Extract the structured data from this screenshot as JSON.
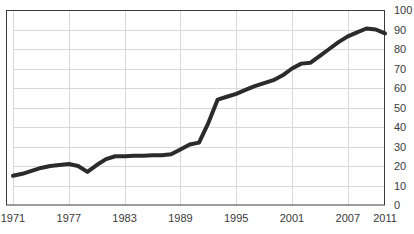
{
  "chart_data": {
    "type": "line",
    "title": "",
    "subtitle": "",
    "xlabel": "",
    "ylabel": "",
    "xlim": [
      1971,
      2011
    ],
    "ylim": [
      0,
      100
    ],
    "grid": true,
    "legend": false,
    "legend_position": "none",
    "y_axis_position": "right",
    "x_tick_labels": [
      "1971",
      "1977",
      "1983",
      "1989",
      "1995",
      "2001",
      "2007",
      "2011"
    ],
    "x_tick_values": [
      1971,
      1977,
      1983,
      1989,
      1995,
      2001,
      2007,
      2011
    ],
    "y_tick_labels": [
      "0",
      "10",
      "20",
      "30",
      "40",
      "50",
      "60",
      "70",
      "80",
      "90",
      "100"
    ],
    "y_tick_values": [
      0,
      10,
      20,
      30,
      40,
      50,
      60,
      70,
      80,
      90,
      100
    ],
    "x": [
      1971,
      1972,
      1973,
      1974,
      1975,
      1976,
      1977,
      1978,
      1979,
      1980,
      1981,
      1982,
      1983,
      1984,
      1985,
      1986,
      1987,
      1988,
      1989,
      1990,
      1991,
      1992,
      1993,
      1994,
      1995,
      1996,
      1997,
      1998,
      1999,
      2000,
      2001,
      2002,
      2003,
      2004,
      2005,
      2006,
      2007,
      2008,
      2009,
      2010,
      2011
    ],
    "values": [
      15,
      16,
      17.5,
      19,
      20,
      20.5,
      21,
      20,
      17,
      20.5,
      23.5,
      25,
      25,
      25.2,
      25.3,
      25.5,
      25.5,
      26,
      28.5,
      31,
      32,
      42,
      54,
      55.5,
      57,
      59,
      61,
      62.5,
      64,
      66.5,
      70,
      72.5,
      73,
      76.5,
      80,
      83.5,
      86.5,
      88.5,
      90.5,
      90,
      88
    ],
    "series": [
      {
        "name": "series-1",
        "color": "#2b2b2b",
        "line_width": 4,
        "markers": false,
        "values": [
          15,
          16,
          17.5,
          19,
          20,
          20.5,
          21,
          20,
          17,
          20.5,
          23.5,
          25,
          25,
          25.2,
          25.3,
          25.5,
          25.5,
          26,
          28.5,
          31,
          32,
          42,
          54,
          55.5,
          57,
          59,
          61,
          62.5,
          64,
          66.5,
          70,
          72.5,
          73,
          76.5,
          80,
          83.5,
          86.5,
          88.5,
          90.5,
          90,
          88
        ]
      }
    ]
  },
  "style": {
    "background": "#ffffff",
    "plot_background": "#ffffff",
    "grid_color": "#d8d8d8",
    "axis_color": "#3a3a3a",
    "line_color": "#2b2b2b",
    "tick_label_color": "#3a3a3a"
  },
  "plot_geometry": {
    "left": 13,
    "right": 385,
    "top": 10,
    "bottom": 205
  }
}
